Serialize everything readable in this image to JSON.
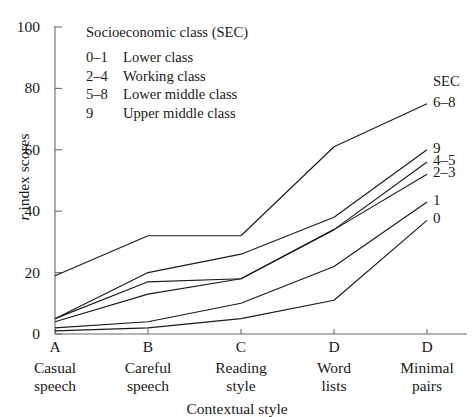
{
  "figure": {
    "legend": {
      "title": "Socioeconomic class (SEC)",
      "rows": [
        {
          "code": "0–1",
          "text": "Lower class"
        },
        {
          "code": "2–4",
          "text": "Working class"
        },
        {
          "code": "5–8",
          "text": "Lower middle class"
        },
        {
          "code": "9",
          "text": "Upper middle class"
        }
      ]
    },
    "series_header": "SEC",
    "axis_color": "#6b6b6b",
    "line_color": "#1a1a1a"
  },
  "chart_data": {
    "type": "line",
    "title": "",
    "xlabel": "Contextual style",
    "ylabel": "r index scores",
    "ylim": [
      0,
      100
    ],
    "yticks": [
      0,
      20,
      40,
      60,
      80,
      100
    ],
    "grid": false,
    "legend_position": "right-of-plot",
    "x": [
      "A",
      "B",
      "C",
      "D",
      "D"
    ],
    "categories": [
      "A",
      "B",
      "C",
      "D",
      "D"
    ],
    "category_names": [
      "Casual\nspeech",
      "Careful\nspeech",
      "Reading\nstyle",
      "Word\nlists",
      "Minimal\npairs"
    ],
    "category_lines": [
      [
        "Casual",
        "speech"
      ],
      [
        "Careful",
        "speech"
      ],
      [
        "Reading",
        "style"
      ],
      [
        "Word",
        "lists"
      ],
      [
        "Minimal",
        "pairs"
      ]
    ],
    "series": [
      {
        "name": "6–8",
        "values": [
          19,
          32,
          32,
          61,
          75
        ]
      },
      {
        "name": "9",
        "values": [
          5,
          20,
          26,
          38,
          60
        ]
      },
      {
        "name": "4–5",
        "values": [
          5,
          17,
          18,
          34,
          56
        ]
      },
      {
        "name": "2–3",
        "values": [
          4,
          13,
          18,
          34,
          52
        ]
      },
      {
        "name": "1",
        "values": [
          2,
          4,
          10,
          22,
          43
        ]
      },
      {
        "name": "0",
        "values": [
          1,
          2,
          5,
          11,
          37
        ]
      }
    ]
  }
}
